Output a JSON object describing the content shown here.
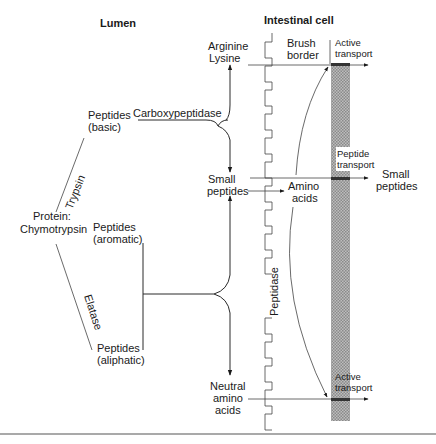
{
  "headers": {
    "lumen": "Lumen",
    "intestinal_cell": "Intestinal cell"
  },
  "lumen": {
    "protein_line1": "Protein:",
    "protein_line2": "Chymotrypsin",
    "enzyme_trypsin": "Trypsin",
    "enzyme_elastase": "Elatase",
    "peptides_basic_line1": "Peptides",
    "peptides_basic_line2": "(basic)",
    "peptides_aromatic_line1": "Peptides",
    "peptides_aromatic_line2": "(aromatic)",
    "peptides_aliphatic_line1": "Peptides",
    "peptides_aliphatic_line2": "(aliphatic)",
    "carboxypeptidase": "Carboxypeptidase"
  },
  "products": {
    "arginine": "Arginine",
    "lysine": "Lysine",
    "small_peptides_line1": "Small",
    "small_peptides_line2": "peptides",
    "neutral_line1": "Neutral",
    "neutral_line2": "amino",
    "neutral_line3": "acids"
  },
  "cell": {
    "brush_line1": "Brush",
    "brush_line2": "border",
    "peptidase": "Peptidase",
    "amino_line1": "Amino",
    "amino_line2": "acids",
    "active_transport_top_line1": "Active",
    "active_transport_top_line2": "transport",
    "peptide_transport_line1": "Peptide",
    "peptide_transport_line2": "transport",
    "active_transport_bottom_line1": "Active",
    "active_transport_bottom_line2": "transport",
    "small_peptides_out_line1": "Small",
    "small_peptides_out_line2": "peptides"
  },
  "colors": {
    "ink": "#1a1a1a",
    "band": "#9a9a9a",
    "background": "#ffffff"
  }
}
